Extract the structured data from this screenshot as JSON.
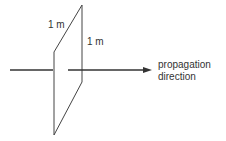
{
  "diagram": {
    "labels": {
      "width": "1 m",
      "height": "1 m",
      "direction_line1": "propagation",
      "direction_line2": "direction"
    },
    "colors": {
      "line": "#333333",
      "background": "#ffffff"
    }
  }
}
